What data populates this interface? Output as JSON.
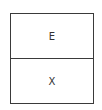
{
  "diagram": {
    "cells": [
      {
        "label": "E"
      },
      {
        "label": "X"
      }
    ]
  }
}
